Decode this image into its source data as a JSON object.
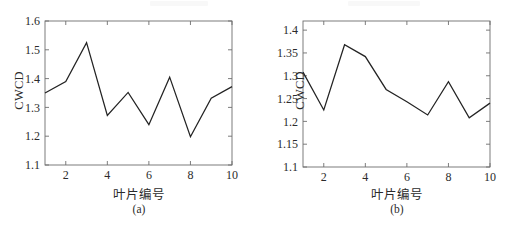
{
  "figure": {
    "panels": [
      {
        "key": "a",
        "caption": "(a)",
        "xlabel": "叶片编号",
        "ylabel": "CWCD",
        "chart_data": {
          "type": "line",
          "title": "",
          "subtitle": "",
          "xlabel": "叶片编号",
          "ylabel": "CWCD",
          "x": [
            1,
            2,
            3,
            4,
            5,
            6,
            7,
            8,
            9,
            10
          ],
          "values": [
            1.35,
            1.39,
            1.525,
            1.272,
            1.352,
            1.24,
            1.405,
            1.198,
            1.332,
            1.372
          ],
          "series": [
            {
              "name": "CWCD",
              "values": [
                1.35,
                1.39,
                1.525,
                1.272,
                1.352,
                1.24,
                1.405,
                1.198,
                1.332,
                1.372
              ]
            }
          ],
          "xlim": [
            1,
            10
          ],
          "ylim": [
            1.1,
            1.6
          ],
          "xticks": [
            2,
            4,
            6,
            8,
            10
          ],
          "yticks": [
            1.1,
            1.2,
            1.3,
            1.4,
            1.5,
            1.6
          ],
          "xticklabels": [
            "2",
            "4",
            "6",
            "8",
            "10"
          ],
          "yticklabels": [
            "1.1",
            "1.2",
            "1.3",
            "1.4",
            "1.5",
            "1.6"
          ],
          "grid": false,
          "legend": false,
          "line_color": "#232323"
        }
      },
      {
        "key": "b",
        "caption": "(b)",
        "xlabel": "叶片编号",
        "ylabel": "CWCD",
        "chart_data": {
          "type": "line",
          "title": "",
          "subtitle": "",
          "xlabel": "叶片编号",
          "ylabel": "CWCD",
          "x": [
            1,
            2,
            3,
            4,
            5,
            6,
            7,
            8,
            9,
            10
          ],
          "values": [
            1.308,
            1.225,
            1.368,
            1.342,
            1.27,
            1.243,
            1.214,
            1.287,
            1.208,
            1.24
          ],
          "series": [
            {
              "name": "CWCD",
              "values": [
                1.308,
                1.225,
                1.368,
                1.342,
                1.27,
                1.243,
                1.214,
                1.287,
                1.208,
                1.24
              ]
            }
          ],
          "xlim": [
            1,
            10
          ],
          "ylim": [
            1.1,
            1.42
          ],
          "xticks": [
            2,
            4,
            6,
            8,
            10
          ],
          "yticks": [
            1.1,
            1.15,
            1.2,
            1.25,
            1.3,
            1.35,
            1.4
          ],
          "xticklabels": [
            "2",
            "4",
            "6",
            "8",
            "10"
          ],
          "yticklabels": [
            "1.1",
            "1.15",
            "1.2",
            "1.25",
            "1.3",
            "1.35",
            "1.4"
          ],
          "grid": false,
          "legend": false,
          "line_color": "#232323"
        }
      }
    ]
  }
}
